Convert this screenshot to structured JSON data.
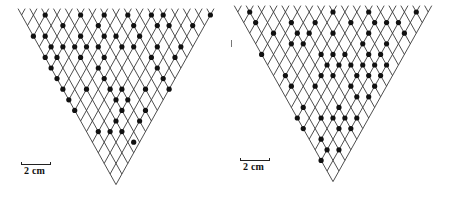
{
  "figure": {
    "lattice": {
      "rows": 16,
      "line_color": "#3a3a3a",
      "dot_color": "#111111"
    },
    "panels": [
      {
        "id": "left",
        "origin_x": 116,
        "top_y": 15,
        "half_dx": 5.9,
        "half_dy": 10.6,
        "scale_bar": {
          "label": "2 cm",
          "x": 21,
          "y": 164,
          "width": 30
        },
        "dots": [
          [
            0,
            -12
          ],
          [
            0,
            -6
          ],
          [
            0,
            -2
          ],
          [
            0,
            2
          ],
          [
            0,
            6
          ],
          [
            0,
            8
          ],
          [
            0,
            16
          ],
          [
            1,
            -9
          ],
          [
            1,
            -3
          ],
          [
            1,
            3
          ],
          [
            1,
            7
          ],
          [
            1,
            9
          ],
          [
            1,
            13
          ],
          [
            2,
            -14
          ],
          [
            2,
            -12
          ],
          [
            2,
            -6
          ],
          [
            2,
            -2
          ],
          [
            2,
            0
          ],
          [
            2,
            4
          ],
          [
            3,
            -11
          ],
          [
            3,
            -9
          ],
          [
            3,
            -7
          ],
          [
            3,
            -5
          ],
          [
            3,
            -3
          ],
          [
            3,
            1
          ],
          [
            3,
            3
          ],
          [
            3,
            7
          ],
          [
            3,
            11
          ],
          [
            4,
            -12
          ],
          [
            4,
            -10
          ],
          [
            4,
            -6
          ],
          [
            4,
            -2
          ],
          [
            4,
            6
          ],
          [
            4,
            10
          ],
          [
            5,
            -11
          ],
          [
            5,
            -3
          ],
          [
            5,
            7
          ],
          [
            6,
            -10
          ],
          [
            6,
            -2
          ],
          [
            6,
            8
          ],
          [
            7,
            -9
          ],
          [
            7,
            -5
          ],
          [
            7,
            -1
          ],
          [
            7,
            1
          ],
          [
            7,
            5
          ],
          [
            7,
            9
          ],
          [
            8,
            -8
          ],
          [
            8,
            0
          ],
          [
            8,
            2
          ],
          [
            9,
            -7
          ],
          [
            9,
            1
          ],
          [
            9,
            5
          ],
          [
            10,
            0
          ],
          [
            10,
            4
          ],
          [
            11,
            -3
          ],
          [
            11,
            -1
          ],
          [
            11,
            1
          ],
          [
            12,
            3
          ]
        ]
      },
      {
        "id": "right",
        "origin_x": 108,
        "top_y": 12,
        "half_dx": 5.95,
        "half_dy": 10.6,
        "scale_bar": {
          "label": "2 cm",
          "x": 15,
          "y": 160,
          "width": 30
        },
        "dots": [
          [
            0,
            -14
          ],
          [
            0,
            0
          ],
          [
            0,
            6
          ],
          [
            0,
            14
          ],
          [
            1,
            -13
          ],
          [
            1,
            -7
          ],
          [
            1,
            -3
          ],
          [
            1,
            3
          ],
          [
            1,
            7
          ],
          [
            1,
            9
          ],
          [
            1,
            11
          ],
          [
            2,
            -10
          ],
          [
            2,
            -6
          ],
          [
            2,
            -4
          ],
          [
            2,
            0
          ],
          [
            2,
            6
          ],
          [
            2,
            12
          ],
          [
            3,
            -7
          ],
          [
            3,
            -5
          ],
          [
            3,
            5
          ],
          [
            3,
            9
          ],
          [
            4,
            -12
          ],
          [
            4,
            -2
          ],
          [
            4,
            0
          ],
          [
            4,
            2
          ],
          [
            4,
            6
          ],
          [
            4,
            8
          ],
          [
            5,
            -1
          ],
          [
            5,
            1
          ],
          [
            5,
            3
          ],
          [
            5,
            5
          ],
          [
            5,
            7
          ],
          [
            5,
            9
          ],
          [
            6,
            -8
          ],
          [
            6,
            -2
          ],
          [
            6,
            0
          ],
          [
            6,
            4
          ],
          [
            6,
            6
          ],
          [
            6,
            8
          ],
          [
            7,
            -7
          ],
          [
            7,
            -3
          ],
          [
            7,
            3
          ],
          [
            7,
            7
          ],
          [
            8,
            4
          ],
          [
            8,
            6
          ],
          [
            9,
            -5
          ],
          [
            9,
            1
          ],
          [
            10,
            -6
          ],
          [
            10,
            -2
          ],
          [
            10,
            0
          ],
          [
            10,
            2
          ],
          [
            10,
            4
          ],
          [
            11,
            -5
          ],
          [
            11,
            1
          ],
          [
            11,
            3
          ],
          [
            12,
            -2
          ],
          [
            13,
            -1
          ],
          [
            13,
            1
          ],
          [
            14,
            -2
          ]
        ]
      }
    ]
  }
}
